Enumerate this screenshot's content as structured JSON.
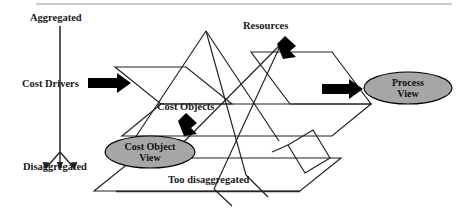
{
  "figure": {
    "type": "pyramid-planes-diagram",
    "background_color": "#ffffff",
    "line_color": "#231f20",
    "arrow_color": "#000000",
    "ellipse_fill": "#a6a6a6",
    "ellipse_stroke": "#000000",
    "labels": {
      "aggregated": "Aggregated",
      "disaggregated": "Disaggregated",
      "cost_drivers": "Cost Drivers",
      "resources": "Resources",
      "cost_objects": "Cost Objects",
      "too_disaggregated": "Too disaggregated"
    },
    "ellipses": {
      "process_view_line1": "Process",
      "process_view_line2": "View",
      "cost_object_view_line1": "Cost Object",
      "cost_object_view_line2": "View"
    },
    "axis": {
      "name": "vertical-aggregation-axis",
      "top_label": "Aggregated",
      "bottom_label": "Disaggregated"
    },
    "arrows": [
      {
        "name": "cost-drivers-arrow",
        "direction": "right"
      },
      {
        "name": "resources-arrow",
        "direction": "down-left"
      },
      {
        "name": "cost-objects-arrow",
        "direction": "down-left"
      },
      {
        "name": "process-view-arrow",
        "direction": "right"
      }
    ]
  }
}
